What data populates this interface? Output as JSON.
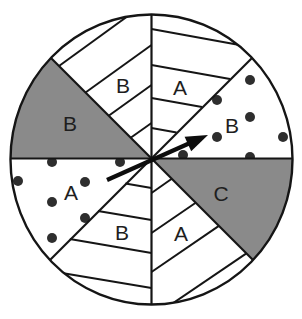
{
  "figure": {
    "type": "spinner",
    "sector_count": 8,
    "sectors": [
      {
        "label": "B",
        "fill": "dotted",
        "angle_start": 0,
        "angle_end": 45
      },
      {
        "label": "A",
        "fill": "hatched",
        "angle_start": 45,
        "angle_end": 90
      },
      {
        "label": "B",
        "fill": "hatched",
        "angle_start": 90,
        "angle_end": 135
      },
      {
        "label": "B",
        "fill": "shaded",
        "angle_start": 135,
        "angle_end": 180
      },
      {
        "label": "A",
        "fill": "dotted",
        "angle_start": 180,
        "angle_end": 225
      },
      {
        "label": "B",
        "fill": "hatched",
        "angle_start": 225,
        "angle_end": 270
      },
      {
        "label": "A",
        "fill": "hatched",
        "angle_start": 270,
        "angle_end": 315
      },
      {
        "label": "C",
        "fill": "shaded",
        "angle_start": 315,
        "angle_end": 360
      }
    ],
    "arrow": {
      "points_to_sector_index": 0,
      "points_to_label": "B"
    },
    "colors": {
      "shaded": "#8a8a8a",
      "stroke": "#151515",
      "dots": "#2e2e2e",
      "background": "#ffffff"
    }
  }
}
